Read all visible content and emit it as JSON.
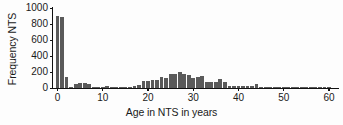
{
  "chart_data": {
    "type": "bar",
    "title": "",
    "subtitle": "",
    "xlabel": "Age in NTS in years",
    "ylabel": "Frequency NTS",
    "xlim": [
      -1,
      62
    ],
    "ylim": [
      0,
      1000
    ],
    "grid": false,
    "legend": null,
    "bar_color": "#5a5a5a",
    "axis_color": "#111111",
    "xticks": [
      0,
      10,
      20,
      30,
      40,
      50,
      60
    ],
    "xtick_labels": [
      "0",
      "10",
      "20",
      "30",
      "40",
      "50",
      "60"
    ],
    "yticks": [
      0,
      200,
      400,
      600,
      800,
      1000
    ],
    "ytick_labels": [
      "0",
      "200",
      "400",
      "600",
      "800",
      "1000"
    ],
    "categories": [
      0,
      1,
      2,
      3,
      4,
      5,
      6,
      7,
      8,
      9,
      10,
      11,
      12,
      13,
      14,
      15,
      16,
      17,
      18,
      19,
      20,
      21,
      22,
      23,
      24,
      25,
      26,
      27,
      28,
      29,
      30,
      31,
      32,
      33,
      34,
      35,
      36,
      37,
      38,
      39,
      40,
      41,
      42,
      43,
      44,
      45,
      46,
      47,
      48,
      49,
      50,
      51,
      52,
      53,
      54,
      55,
      56,
      57,
      58,
      59,
      60,
      61
    ],
    "values": [
      905,
      890,
      140,
      12,
      55,
      58,
      57,
      55,
      12,
      10,
      15,
      20,
      14,
      12,
      10,
      8,
      12,
      30,
      38,
      85,
      90,
      95,
      100,
      135,
      130,
      175,
      180,
      205,
      172,
      160,
      130,
      135,
      150,
      80,
      75,
      75,
      110,
      70,
      30,
      25,
      28,
      25,
      22,
      25,
      45,
      15,
      12,
      10,
      8,
      5,
      6,
      5,
      4,
      4,
      3,
      3,
      12,
      4,
      3,
      2,
      2,
      0
    ]
  }
}
